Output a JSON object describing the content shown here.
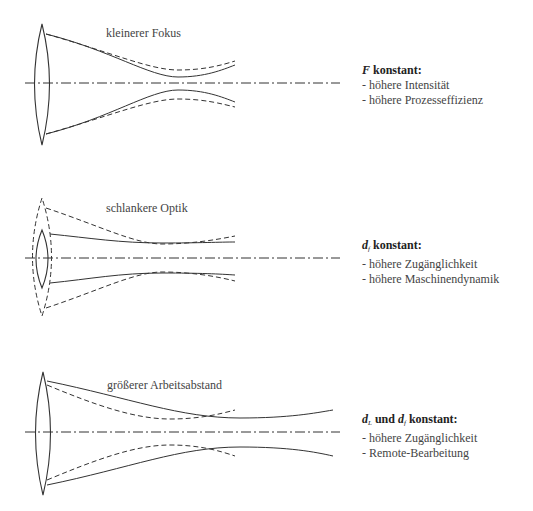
{
  "panels": [
    {
      "id": "small-focus",
      "caption": "kleinerer Fokus",
      "condition": {
        "symbol": "F",
        "suffix": " konstant:"
      },
      "benefits": [
        "- höhere Intensität",
        "- höhere Prozesseffizienz"
      ]
    },
    {
      "id": "slim-optics",
      "caption": "schlankere Optik",
      "condition": {
        "symbol": "d",
        "subscript": "f",
        "suffix": " konstant:"
      },
      "benefits": [
        "- höhere Zugänglichkeit",
        "- höhere Maschinendynamik"
      ]
    },
    {
      "id": "larger-working-distance",
      "caption": "größerer Arbeitsabstand",
      "condition": {
        "symbol": "d",
        "subscript": "L",
        "middle": " und ",
        "symbol2": "d",
        "subscript2": "f",
        "suffix": " konstant:"
      },
      "benefits": [
        "- höhere Zugänglichkeit",
        "- Remote-Bearbeitung"
      ]
    }
  ],
  "colors": {
    "line": "#333333",
    "text": "#444444"
  }
}
